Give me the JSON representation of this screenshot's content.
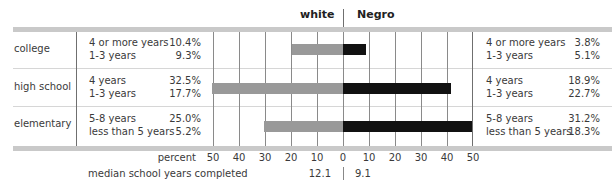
{
  "chart_data": {
    "type": "bar",
    "orientation": "horizontal-butterfly",
    "title": "",
    "header": {
      "left": "white",
      "right": "Negro"
    },
    "categories": [
      "college",
      "high school",
      "elementary"
    ],
    "x_axis": {
      "label": "percent",
      "ticks_left": [
        "50",
        "40",
        "30",
        "20",
        "10",
        "0"
      ],
      "ticks_right": [
        "10",
        "20",
        "30",
        "40",
        "50"
      ],
      "range": [
        0,
        50
      ],
      "grid": true
    },
    "series": [
      {
        "name": "white",
        "color": "#999999",
        "values": [
          19.7,
          50.2,
          30.2
        ],
        "breakdown": [
          [
            {
              "label": "4 or more years",
              "value": "10.4%"
            },
            {
              "label": "1-3 years",
              "value": "9.3%"
            }
          ],
          [
            {
              "label": "4 years",
              "value": "32.5%"
            },
            {
              "label": "1-3 years",
              "value": "17.7%"
            }
          ],
          [
            {
              "label": "5-8 years",
              "value": "25.0%"
            },
            {
              "label": "less than 5 years",
              "value": "5.2%"
            }
          ]
        ]
      },
      {
        "name": "Negro",
        "color": "#111111",
        "values": [
          8.9,
          41.6,
          49.5
        ],
        "breakdown": [
          [
            {
              "label": "4 or more years",
              "value": "3.8%"
            },
            {
              "label": "1-3 years",
              "value": "5.1%"
            }
          ],
          [
            {
              "label": "4 years",
              "value": "18.9%"
            },
            {
              "label": "1-3 years",
              "value": "22.7%"
            }
          ],
          [
            {
              "label": "5-8 years",
              "value": "31.2%"
            },
            {
              "label": "less than 5 years",
              "value": "18.3%"
            }
          ]
        ]
      }
    ],
    "median": {
      "label": "median school years completed",
      "white": "12.1",
      "negro": "9.1"
    }
  }
}
